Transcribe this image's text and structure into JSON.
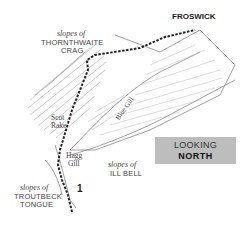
{
  "map": {
    "summit": "FROSWICK",
    "labels": {
      "thornthwaite_prefix": "slopes of",
      "thornthwaite_line1": "THORNTHWAITE",
      "thornthwaite_line2": "CRAG",
      "scot_rake_line1": "Scot",
      "scot_rake_line2": "Rake",
      "blue_gill": "Blue Gill",
      "hagg_gill_line1": "Hagg",
      "hagg_gill_line2": "Gill",
      "ill_bell_prefix": "slopes of",
      "ill_bell_name": "ILL BELL",
      "troutbeck_prefix": "slopes of",
      "troutbeck_line1": "TROUTBECK",
      "troutbeck_line2": "TONGUE"
    },
    "route_marker": "1",
    "direction_box": {
      "line1": "LOOKING",
      "line2": "NORTH",
      "color": "#bdbdbd"
    }
  }
}
